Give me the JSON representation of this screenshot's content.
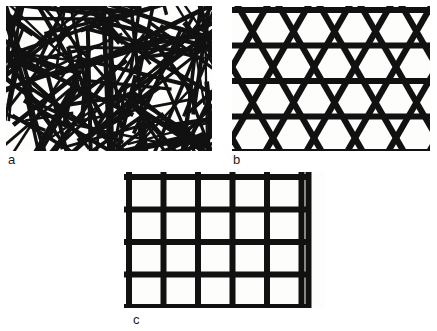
{
  "figure": {
    "background_color": "#ffffff",
    "ink_color": "#111111",
    "panel_fill_color": "#fdfdfb",
    "panels": [
      {
        "id": "panel-a",
        "label": "a",
        "name": "random-fiber-mat",
        "description": "Randomly oriented non-woven fiber mat with overlapping straight strands",
        "geometry": {
          "type": "random-fibers",
          "fiber_count": 165,
          "fiber_thickness_px": [
            2.2,
            5.0
          ],
          "fiber_length_px": [
            45,
            185
          ],
          "orientation_deg_range": [
            0,
            180
          ],
          "width_px": 206,
          "height_px": 145,
          "seed": 20240731
        }
      },
      {
        "id": "panel-b",
        "label": "b",
        "name": "triaxial-hexagonal-grid",
        "description": "Triaxial geogrid: horizontal ribs crossed by two sets of 60 degree diagonal ribs forming hexagons and triangles",
        "geometry": {
          "type": "triaxial-grid",
          "rib_thickness_px": 6.2,
          "horizontal_rows": 5,
          "row_spacing_px": 35.5,
          "diagonal_angle_deg": 60,
          "diagonal_spacing_px": 41,
          "width_px": 198,
          "height_px": 145
        }
      },
      {
        "id": "panel-c",
        "label": "c",
        "name": "biaxial-square-grid",
        "description": "Biaxial geogrid: orthogonal ribs forming square apertures with short protruding stubs at edges",
        "geometry": {
          "type": "biaxial-grid",
          "rib_thickness_px": 6.0,
          "vertical_strands": 6,
          "horizontal_strands": 5,
          "cell_width_px": 34.5,
          "cell_height_px": 32.5,
          "stub_length_px": 7,
          "width_px": 201,
          "height_px": 136
        }
      }
    ]
  }
}
